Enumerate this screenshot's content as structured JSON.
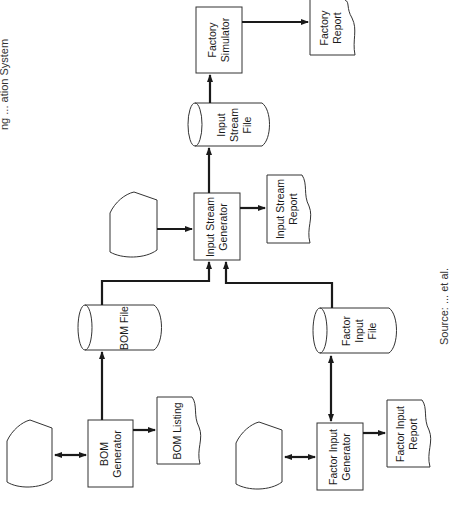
{
  "title_fragment": "ng ... ation System",
  "caption_fragment": "Source: ... et al.",
  "nodes": {
    "factory_simulator": {
      "line1": "Factory",
      "line2": "Simulator"
    },
    "factory_report": {
      "line1": "Factory",
      "line2": "Report"
    },
    "input_stream_file": {
      "line1": "Input",
      "line2": "Stream",
      "line3": "File"
    },
    "input_stream_generator": {
      "line1": "Input Stream",
      "line2": "Generator"
    },
    "input_stream_report": {
      "line1": "Input Stream",
      "line2": "Report"
    },
    "bom_file": {
      "line1": "BOM File"
    },
    "bom_generator": {
      "line1": "BOM",
      "line2": "Generator"
    },
    "bom_listing": {
      "line1": "BOM Listing"
    },
    "factor_input_file": {
      "line1": "Factor",
      "line2": "Input",
      "line3": "File"
    },
    "factor_input_generator": {
      "line1": "Factor Input",
      "line2": "Generator"
    },
    "factor_input_report": {
      "line1": "Factor Input",
      "line2": "Report"
    }
  },
  "colors": {
    "stroke": "#1a1a1a",
    "background": "#ffffff"
  }
}
